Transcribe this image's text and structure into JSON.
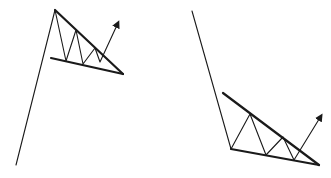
{
  "diagram": {
    "stroke_color": "#1a1a1a",
    "background": "#ffffff",
    "figures": [
      {
        "name": "bullish-pennant-left",
        "pole": [
          [
            16,
            165
          ],
          [
            55,
            10
          ]
        ],
        "upper_trendline": [
          [
            55,
            10
          ],
          [
            123,
            74
          ]
        ],
        "lower_trendline": [
          [
            51,
            58
          ],
          [
            123,
            74
          ]
        ],
        "zigzag": [
          [
            55,
            10
          ],
          [
            66,
            61
          ],
          [
            76,
            30
          ],
          [
            83,
            64
          ],
          [
            95,
            48
          ],
          [
            100,
            62
          ],
          [
            118,
            23
          ]
        ],
        "arrow_tip": [
          118,
          23
        ]
      },
      {
        "name": "falling-wedge-right",
        "pole": [
          [
            192,
            11
          ],
          [
            231,
            149
          ]
        ],
        "upper_trendline": [
          [
            223,
            93
          ],
          [
            319,
            165
          ]
        ],
        "lower_trendline": [
          [
            231,
            149
          ],
          [
            319,
            165
          ]
        ],
        "zigzag": [
          [
            231,
            149
          ],
          [
            250,
            114
          ],
          [
            266,
            155
          ],
          [
            283,
            137
          ],
          [
            294,
            160
          ],
          [
            321,
            116
          ]
        ],
        "arrow_tip": [
          321,
          116
        ]
      }
    ]
  }
}
